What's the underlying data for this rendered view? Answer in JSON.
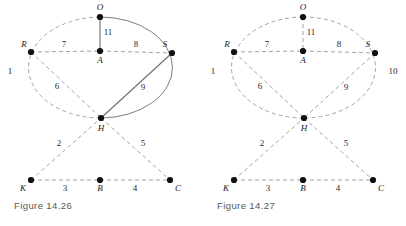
{
  "page": {
    "background_color": "#ffffff",
    "width": 406,
    "height": 226
  },
  "style": {
    "node_color": "#111111",
    "dashed_edge_color": "#9a9a9a",
    "solid_edge_color": "#6f6f6f",
    "label_color": "#1a1a1a",
    "caption_color": "#58585a"
  },
  "figures": [
    {
      "id": "figure-14-26",
      "caption": "Figure 14.26",
      "nodes": [
        {
          "id": "O",
          "label": "O",
          "x": 100,
          "y": 17,
          "label_x": 100,
          "label_y": 10
        },
        {
          "id": "R",
          "label": "R",
          "x": 31,
          "y": 52,
          "label_x": 24,
          "label_y": 47
        },
        {
          "id": "A",
          "label": "A",
          "x": 100,
          "y": 51,
          "label_x": 100,
          "label_y": 63
        },
        {
          "id": "S",
          "label": "S",
          "x": 172,
          "y": 53,
          "label_x": 165,
          "label_y": 47
        },
        {
          "id": "H",
          "label": "H",
          "x": 101,
          "y": 118,
          "label_x": 101,
          "label_y": 131
        },
        {
          "id": "K",
          "label": "K",
          "x": 31,
          "y": 180,
          "label_x": 23,
          "label_y": 191
        },
        {
          "id": "B",
          "label": "B",
          "x": 100,
          "y": 180,
          "label_x": 100,
          "label_y": 191
        },
        {
          "id": "C",
          "label": "C",
          "x": 170,
          "y": 180,
          "label_x": 178,
          "label_y": 191
        }
      ],
      "edges": [
        {
          "from": "O",
          "to": "A",
          "weight": "11",
          "style": "solid",
          "label_x": 108,
          "label_y": 35
        },
        {
          "from": "R",
          "to": "A",
          "weight": "7",
          "style": "dashed",
          "label_x": 64,
          "label_y": 47
        },
        {
          "from": "A",
          "to": "S",
          "weight": "8",
          "style": "dashed",
          "label_x": 136,
          "label_y": 47
        },
        {
          "from": "R",
          "to": "H",
          "weight": "6",
          "style": "dashed",
          "label_x": 57,
          "label_y": 89
        },
        {
          "from": "S",
          "to": "H",
          "weight": "9",
          "style": "solid",
          "label_x": 143,
          "label_y": 90
        },
        {
          "from": "K",
          "to": "H",
          "weight": "2",
          "style": "dashed",
          "label_x": 59,
          "label_y": 146
        },
        {
          "from": "H",
          "to": "C",
          "weight": "5",
          "style": "dashed",
          "label_x": 143,
          "label_y": 146
        },
        {
          "from": "K",
          "to": "B",
          "weight": "3",
          "style": "dashed",
          "label_x": 65,
          "label_y": 191
        },
        {
          "from": "B",
          "to": "C",
          "weight": "4",
          "style": "dashed",
          "label_x": 135,
          "label_y": 191
        }
      ],
      "arcs": [
        {
          "id": "left-arc",
          "from": "O",
          "to": "H",
          "side": "left",
          "weight": "1",
          "style": "dashed",
          "label_x": 10,
          "label_y": 74
        },
        {
          "id": "right-arc",
          "from": "O",
          "to": "H",
          "side": "right",
          "weight": "",
          "style": "solid",
          "label_x": 0,
          "label_y": 0
        }
      ]
    },
    {
      "id": "figure-14-27",
      "caption": "Figure 14.27",
      "nodes": [
        {
          "id": "O",
          "label": "O",
          "x": 100,
          "y": 17,
          "label_x": 100,
          "label_y": 10
        },
        {
          "id": "R",
          "label": "R",
          "x": 31,
          "y": 52,
          "label_x": 24,
          "label_y": 47
        },
        {
          "id": "A",
          "label": "A",
          "x": 100,
          "y": 51,
          "label_x": 100,
          "label_y": 63
        },
        {
          "id": "S",
          "label": "S",
          "x": 172,
          "y": 53,
          "label_x": 165,
          "label_y": 47
        },
        {
          "id": "H",
          "label": "H",
          "x": 101,
          "y": 118,
          "label_x": 101,
          "label_y": 131
        },
        {
          "id": "K",
          "label": "K",
          "x": 31,
          "y": 180,
          "label_x": 23,
          "label_y": 191
        },
        {
          "id": "B",
          "label": "B",
          "x": 100,
          "y": 180,
          "label_x": 100,
          "label_y": 191
        },
        {
          "id": "C",
          "label": "C",
          "x": 170,
          "y": 180,
          "label_x": 178,
          "label_y": 191
        }
      ],
      "edges": [
        {
          "from": "O",
          "to": "A",
          "weight": "11",
          "style": "dashed",
          "label_x": 108,
          "label_y": 35
        },
        {
          "from": "R",
          "to": "A",
          "weight": "7",
          "style": "dashed",
          "label_x": 64,
          "label_y": 47
        },
        {
          "from": "A",
          "to": "S",
          "weight": "8",
          "style": "dashed",
          "label_x": 136,
          "label_y": 47
        },
        {
          "from": "R",
          "to": "H",
          "weight": "6",
          "style": "dashed",
          "label_x": 57,
          "label_y": 89
        },
        {
          "from": "S",
          "to": "H",
          "weight": "9",
          "style": "dashed",
          "label_x": 143,
          "label_y": 90
        },
        {
          "from": "K",
          "to": "H",
          "weight": "2",
          "style": "dashed",
          "label_x": 59,
          "label_y": 146
        },
        {
          "from": "H",
          "to": "C",
          "weight": "5",
          "style": "dashed",
          "label_x": 143,
          "label_y": 146
        },
        {
          "from": "K",
          "to": "B",
          "weight": "3",
          "style": "dashed",
          "label_x": 65,
          "label_y": 191
        },
        {
          "from": "B",
          "to": "C",
          "weight": "4",
          "style": "dashed",
          "label_x": 135,
          "label_y": 191
        }
      ],
      "arcs": [
        {
          "id": "left-arc",
          "from": "O",
          "to": "H",
          "side": "left",
          "weight": "1",
          "style": "dashed",
          "label_x": 10,
          "label_y": 74
        },
        {
          "id": "right-arc",
          "from": "O",
          "to": "H",
          "side": "right",
          "weight": "10",
          "style": "dashed",
          "label_x": 190,
          "label_y": 74
        }
      ]
    }
  ]
}
